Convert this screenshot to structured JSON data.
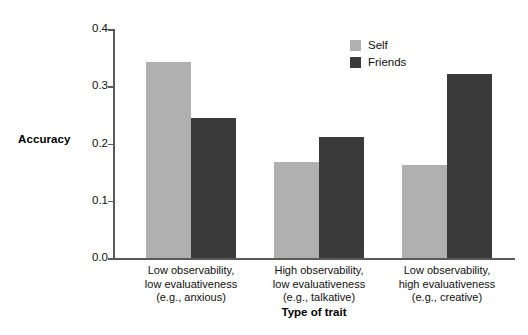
{
  "chart_data": {
    "type": "bar",
    "title": "",
    "xlabel": "Type of trait",
    "ylabel": "Accuracy",
    "ylim": [
      0.0,
      0.4
    ],
    "yticks": [
      "0.0",
      "0.1",
      "0.2",
      "0.3",
      "0.4"
    ],
    "ytick_values": [
      0.0,
      0.1,
      0.2,
      0.3,
      0.4
    ],
    "grid": false,
    "legend_position": "top-right",
    "categories": [
      "Low observability, low evaluativeness (e.g., anxious)",
      "High observability, low evaluativeness (e.g., talkative)",
      "Low observability, high evaluativeness (e.g., creative)"
    ],
    "category_lines": [
      [
        "Low observability,",
        "low evaluativeness",
        "(e.g., anxious)"
      ],
      [
        "High observability,",
        "low evaluativeness",
        "(e.g., talkative)"
      ],
      [
        "Low observability,",
        "high evaluativeness",
        "(e.g., creative)"
      ]
    ],
    "series": [
      {
        "name": "Self",
        "color": "#b0b0b0",
        "values": [
          0.343,
          0.168,
          0.163
        ]
      },
      {
        "name": "Friends",
        "color": "#3a3a3a",
        "values": [
          0.245,
          0.211,
          0.322
        ]
      }
    ]
  },
  "legend": {
    "items": [
      {
        "label": "Self",
        "swatch": "self-swatch"
      },
      {
        "label": "Friends",
        "swatch": "friends-swatch"
      }
    ]
  },
  "axes": {
    "y_title": "Accuracy",
    "x_title": "Type of trait"
  }
}
